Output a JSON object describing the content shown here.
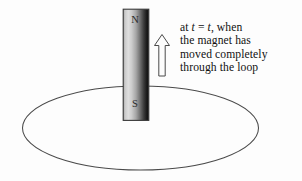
{
  "figure": {
    "name": "bar-magnet-through-conducting-loop",
    "background_color": "#fdfdfd",
    "caption": {
      "line1_prefix": "at ",
      "line1_var1": "t",
      "line1_mid": " = ",
      "line1_var2": "t",
      "line1_suffix": ", when",
      "line2": "the magnet has",
      "line3": "moved completely",
      "line4": "through the loop",
      "full_text": "at t = t, when the magnet has moved completely through the loop"
    },
    "magnet": {
      "north_label": "N",
      "south_label": "S",
      "border_color": "#3a3a3a",
      "gradient_light": "#e4e4e4",
      "gradient_dark": "#111111"
    },
    "arrow": {
      "direction": "up",
      "label": "motion-direction",
      "stroke_color": "#4a4a4a",
      "fill_color": "#fdfdfd"
    },
    "loop": {
      "label": "conducting-loop",
      "stroke_color": "#4a4a4a"
    }
  }
}
